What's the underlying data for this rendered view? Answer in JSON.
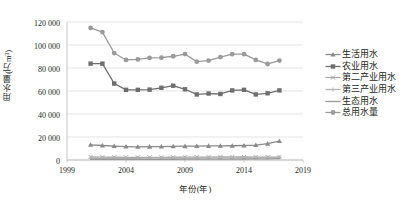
{
  "chart_data": {
    "type": "line",
    "title": "",
    "xlabel": "年份(年)",
    "ylabel": "用水量(万m³)",
    "xlim": [
      1999,
      2019
    ],
    "ylim": [
      0,
      120000
    ],
    "xticks": [
      "1999",
      "2004",
      "2009",
      "2014",
      "2019"
    ],
    "yticks": [
      "0",
      "20 000",
      "40 000",
      "60 000",
      "80 000",
      "100 000",
      "120 000"
    ],
    "grid": true,
    "legend_position": "right",
    "x": [
      2001,
      2002,
      2003,
      2004,
      2005,
      2006,
      2007,
      2008,
      2009,
      2010,
      2011,
      2012,
      2013,
      2014,
      2015,
      2016,
      2017
    ],
    "series": [
      {
        "name": "生活用水",
        "color": "#8a8a8a",
        "marker": "triangle",
        "values": [
          13200,
          12600,
          12100,
          11700,
          11500,
          11600,
          11700,
          11900,
          12000,
          12100,
          12200,
          12300,
          12400,
          12600,
          13000,
          14200,
          16500
        ]
      },
      {
        "name": "农业用水",
        "color": "#6e6e6e",
        "marker": "square",
        "values": [
          83800,
          83800,
          66500,
          61000,
          61000,
          61200,
          62800,
          64600,
          61500,
          57000,
          57800,
          57400,
          60500,
          61000,
          57000,
          58000,
          60500
        ]
      },
      {
        "name": "第二产业用水",
        "color": "#a8a8a8",
        "marker": "cross",
        "values": [
          2600,
          2500,
          2400,
          2300,
          2250,
          2300,
          2350,
          2400,
          2450,
          2500,
          2550,
          2600,
          2650,
          2600,
          2550,
          2500,
          2450
        ]
      },
      {
        "name": "第三产业用水",
        "color": "#b5b5b5",
        "marker": "plus",
        "values": [
          1500,
          1500,
          1450,
          1450,
          1500,
          1550,
          1600,
          1650,
          1700,
          1750,
          1800,
          1850,
          1900,
          1950,
          2000,
          2100,
          2300
        ]
      },
      {
        "name": "生态用水",
        "color": "#989898",
        "marker": "line",
        "values": [
          500,
          520,
          540,
          560,
          580,
          600,
          620,
          650,
          680,
          700,
          730,
          760,
          800,
          850,
          900,
          1000,
          1200
        ]
      },
      {
        "name": "总用水量",
        "color": "#9a9a9a",
        "marker": "circle",
        "values": [
          114800,
          111200,
          93000,
          87000,
          87500,
          88800,
          89000,
          90200,
          92100,
          85500,
          86500,
          89500,
          92000,
          92000,
          87000,
          83500,
          86500
        ]
      }
    ]
  }
}
